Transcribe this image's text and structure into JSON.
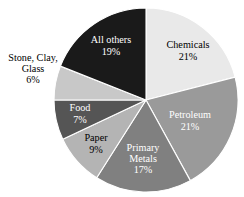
{
  "chart_data": {
    "type": "pie",
    "title": "",
    "subtitle": "",
    "xlabel": "",
    "ylabel": "",
    "legend_position": "none",
    "grid": false,
    "start_angle_deg": 0,
    "direction": "clockwise",
    "units": "percent",
    "categories": [
      "Chemicals",
      "Petroleum",
      "Primary Metals",
      "Paper",
      "Food",
      "Stone, Clay, Glass",
      "All others"
    ],
    "values": [
      21,
      21,
      17,
      9,
      7,
      6,
      19
    ],
    "labels": [
      "21%",
      "21%",
      "17%",
      "9%",
      "7%",
      "6%",
      "19%"
    ],
    "colors": [
      "#e9e9e9",
      "#9a9a9a",
      "#808080",
      "#b4b4b4",
      "#555555",
      "#c8c8c8",
      "#1a1a1a"
    ]
  },
  "chart": {
    "slices": [
      {
        "name": "Chemicals",
        "name_lines": [
          "Chemicals"
        ],
        "value": 21,
        "percent_label": "21%",
        "color": "#e9e9e9",
        "text_color": "#000000",
        "label_placement": "inside",
        "label_x": 188,
        "label_y": 52
      },
      {
        "name": "Petroleum",
        "name_lines": [
          "Petroleum"
        ],
        "value": 21,
        "percent_label": "21%",
        "color": "#9a9a9a",
        "text_color": "#ffffff",
        "label_placement": "inside",
        "label_x": 190,
        "label_y": 122
      },
      {
        "name": "Primary Metals",
        "name_lines": [
          "Primary",
          "Metals"
        ],
        "value": 17,
        "percent_label": "17%",
        "color": "#808080",
        "text_color": "#ffffff",
        "label_placement": "inside",
        "label_x": 143,
        "label_y": 160
      },
      {
        "name": "Paper",
        "name_lines": [
          "Paper"
        ],
        "value": 9,
        "percent_label": "9%",
        "color": "#b4b4b4",
        "text_color": "#000000",
        "label_placement": "inside",
        "label_x": 96,
        "label_y": 145
      },
      {
        "name": "Food",
        "name_lines": [
          "Food"
        ],
        "value": 7,
        "percent_label": "7%",
        "color": "#555555",
        "text_color": "#ffffff",
        "label_placement": "inside",
        "label_x": 80,
        "label_y": 115
      },
      {
        "name": "Stone, Clay, Glass",
        "name_lines": [
          "Stone, Clay,",
          "Glass"
        ],
        "value": 6,
        "percent_label": "6%",
        "color": "#c8c8c8",
        "text_color": "#000000",
        "label_placement": "outside-left",
        "label_x": 33,
        "label_y": 72
      },
      {
        "name": "All others",
        "name_lines": [
          "All others"
        ],
        "value": 19,
        "percent_label": "19%",
        "color": "#1a1a1a",
        "text_color": "#ffffff",
        "label_placement": "inside",
        "label_x": 111,
        "label_y": 47
      }
    ],
    "geometry": {
      "center_x": 146,
      "center_y": 100,
      "radius": 92
    }
  }
}
